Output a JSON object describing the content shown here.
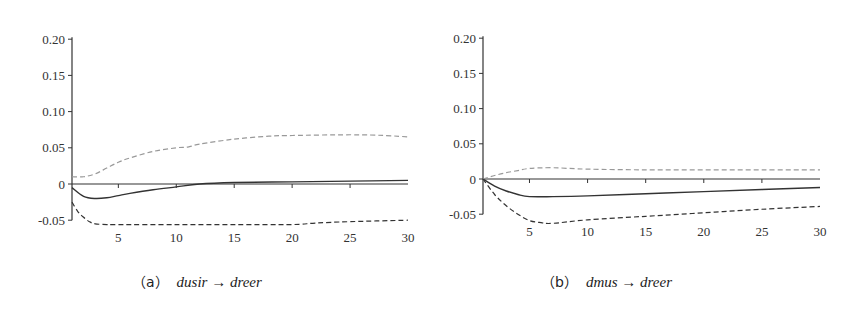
{
  "chart_data": [
    {
      "type": "line",
      "panel": "a",
      "caption_label": "a",
      "caption_expr": "dusir → dreer",
      "title": "",
      "xlabel": "",
      "ylabel": "",
      "xlim": [
        1,
        30
      ],
      "ylim": [
        -0.05,
        0.2
      ],
      "xticks": [
        5,
        10,
        15,
        20,
        25,
        30
      ],
      "xtick_labels": [
        "5",
        "10",
        "15",
        "20",
        "25",
        "30"
      ],
      "yticks": [
        -0.05,
        0,
        0.05,
        0.1,
        0.15,
        0.2
      ],
      "ytick_labels": [
        "-0.05",
        "0",
        "0.05",
        "0.10",
        "0.15",
        "0.20"
      ],
      "grid": false,
      "legend": null,
      "series": [
        {
          "name": "response",
          "style": "solid",
          "color": "#333333",
          "x": [
            1,
            2,
            3,
            4,
            5,
            6,
            8,
            10,
            12,
            15,
            20,
            25,
            30
          ],
          "values": [
            -0.005,
            -0.017,
            -0.02,
            -0.019,
            -0.016,
            -0.013,
            -0.008,
            -0.004,
            0.0,
            0.002,
            0.003,
            0.004,
            0.005
          ]
        },
        {
          "name": "upper_band",
          "style": "dashed",
          "color": "#999999",
          "x": [
            1,
            2,
            3,
            4,
            5,
            6,
            8,
            10,
            11,
            12,
            15,
            18,
            20,
            25,
            28,
            30
          ],
          "values": [
            0.01,
            0.01,
            0.014,
            0.022,
            0.03,
            0.036,
            0.045,
            0.05,
            0.051,
            0.055,
            0.062,
            0.066,
            0.067,
            0.068,
            0.067,
            0.065
          ]
        },
        {
          "name": "lower_band",
          "style": "dashed",
          "color": "#333333",
          "x": [
            1,
            1.5,
            2,
            2.5,
            3,
            4,
            5,
            10,
            15,
            20,
            22,
            25,
            30
          ],
          "values": [
            -0.025,
            -0.038,
            -0.046,
            -0.052,
            -0.055,
            -0.056,
            -0.056,
            -0.056,
            -0.056,
            -0.056,
            -0.054,
            -0.052,
            -0.05
          ]
        }
      ]
    },
    {
      "type": "line",
      "panel": "b",
      "caption_label": "b",
      "caption_expr": "dmus → dreer",
      "title": "",
      "xlabel": "",
      "ylabel": "",
      "xlim": [
        1,
        30
      ],
      "ylim": [
        -0.05,
        0.2
      ],
      "xticks": [
        5,
        10,
        15,
        20,
        25,
        30
      ],
      "xtick_labels": [
        "5",
        "10",
        "15",
        "20",
        "25",
        "30"
      ],
      "yticks": [
        -0.05,
        0,
        0.05,
        0.1,
        0.15,
        0.2
      ],
      "ytick_labels": [
        "-0.05",
        "0",
        "0.05",
        "0.10",
        "0.15",
        "0.20"
      ],
      "grid": false,
      "legend": null,
      "series": [
        {
          "name": "response",
          "style": "solid",
          "color": "#333333",
          "x": [
            1,
            2,
            3,
            4,
            5,
            7,
            10,
            15,
            20,
            25,
            30
          ],
          "values": [
            0.0,
            -0.01,
            -0.017,
            -0.022,
            -0.025,
            -0.025,
            -0.024,
            -0.021,
            -0.018,
            -0.015,
            -0.012
          ]
        },
        {
          "name": "upper_band",
          "style": "dashed",
          "color": "#999999",
          "x": [
            1,
            2,
            3,
            4,
            5,
            7,
            10,
            15,
            20,
            25,
            30
          ],
          "values": [
            0.0,
            0.005,
            0.009,
            0.012,
            0.015,
            0.016,
            0.014,
            0.013,
            0.013,
            0.013,
            0.013
          ]
        },
        {
          "name": "lower_band",
          "style": "dashed",
          "color": "#333333",
          "x": [
            1,
            2,
            3,
            4,
            5,
            6,
            7,
            10,
            15,
            20,
            25,
            30
          ],
          "values": [
            0.0,
            -0.022,
            -0.038,
            -0.05,
            -0.059,
            -0.062,
            -0.063,
            -0.058,
            -0.053,
            -0.048,
            -0.043,
            -0.039
          ]
        }
      ]
    }
  ],
  "captions": {
    "a": {
      "label": "（a）",
      "expr": "dusir → dreer"
    },
    "b": {
      "label": "（b）",
      "expr": "dmus → dreer"
    }
  },
  "colors": {
    "axis": "#333333",
    "response": "#333333",
    "upper_band": "#999999",
    "lower_band": "#333333"
  }
}
